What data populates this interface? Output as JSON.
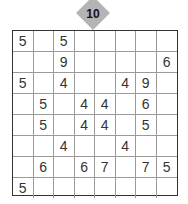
{
  "puzzle": {
    "badge_number": "10",
    "rows": 8,
    "cols": 8,
    "grid": [
      [
        "5",
        "",
        "5",
        "",
        "",
        "",
        "",
        ""
      ],
      [
        "",
        "",
        "9",
        "",
        "",
        "",
        "",
        "6"
      ],
      [
        "5",
        "",
        "4",
        "",
        "",
        "4",
        "9",
        ""
      ],
      [
        "",
        "5",
        "",
        "4",
        "4",
        "",
        "6",
        ""
      ],
      [
        "",
        "5",
        "",
        "4",
        "4",
        "",
        "5",
        ""
      ],
      [
        "",
        "",
        "4",
        "",
        "",
        "4",
        "",
        ""
      ],
      [
        "",
        "6",
        "",
        "6",
        "7",
        "",
        "7",
        "5"
      ],
      [
        "5",
        "",
        "",
        "",
        "",
        "",
        "",
        ""
      ]
    ]
  },
  "colors": {
    "badge": "#b4b4b4",
    "grid_border": "#333333",
    "grid_lines": "#9a9a9a",
    "digits": "#333333"
  }
}
